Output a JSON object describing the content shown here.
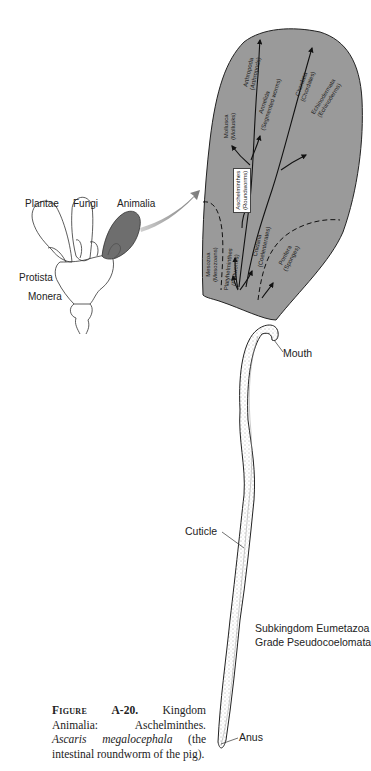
{
  "kingdom_tree": {
    "labels": {
      "plantae": "Plantae",
      "fungi": "Fungi",
      "animalia": "Animalia",
      "protista": "Protista",
      "monera": "Monera"
    },
    "highlight_color": "#6e6e6e"
  },
  "phylogeny_panel": {
    "fill_color": "#9a9a9a",
    "phyla": [
      {
        "name": "Arthropoda",
        "common": "(Arthropods)"
      },
      {
        "name": "Mollusca",
        "common": "(Mollusks)"
      },
      {
        "name": "Annelida",
        "common": "(Segmented worms)"
      },
      {
        "name": "Chordata",
        "common": "(Chordates)"
      },
      {
        "name": "Echinodermata",
        "common": "(Echinoderms)"
      },
      {
        "name": "Aschelminthes",
        "common": "(Roundworms)",
        "highlighted": true
      },
      {
        "name": "Mesozoa",
        "common": "(Mesozoans)"
      },
      {
        "name": "Platyhelminthes",
        "common": "(Flatworms)"
      },
      {
        "name": "Cnidaria",
        "common": "(Coelenterates)"
      },
      {
        "name": "Porifera",
        "common": "(Sponges)"
      }
    ]
  },
  "specimen": {
    "labels": {
      "mouth": "Mouth",
      "cuticle": "Cuticle",
      "anus": "Anus"
    },
    "classification": {
      "line1": "Subkingdom Eumetazoa",
      "line2": "Grade Pseudocoelomata"
    }
  },
  "caption": {
    "figure_label": "Figure",
    "figure_number": "A-20.",
    "text1": " Kingdom Animalia: Aschelminthes. ",
    "species": "Ascaris megalocephala",
    "text2": " (the intestinal roundworm of the pig)."
  }
}
